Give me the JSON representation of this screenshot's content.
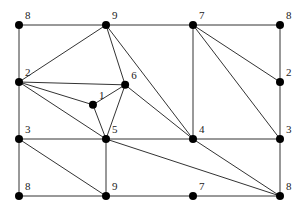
{
  "diagram": {
    "type": "planar-graph",
    "nodes": [
      {
        "id": "n8tl",
        "label": "8",
        "gx": 0,
        "gy": 0
      },
      {
        "id": "n9t",
        "label": "9",
        "gx": 1,
        "gy": 0
      },
      {
        "id": "n7t",
        "label": "7",
        "gx": 2,
        "gy": 0
      },
      {
        "id": "n8tr",
        "label": "8",
        "gx": 3,
        "gy": 0
      },
      {
        "id": "n2l",
        "label": "2",
        "gx": 0,
        "gy": 1
      },
      {
        "id": "n6",
        "label": "6",
        "gx": 1.22,
        "gy": 1.05
      },
      {
        "id": "n1",
        "label": "1",
        "gx": 0.85,
        "gy": 1.4
      },
      {
        "id": "n2r",
        "label": "2",
        "gx": 3,
        "gy": 1
      },
      {
        "id": "n3l",
        "label": "3",
        "gx": 0,
        "gy": 2
      },
      {
        "id": "n5",
        "label": "5",
        "gx": 1,
        "gy": 2
      },
      {
        "id": "n4",
        "label": "4",
        "gx": 2,
        "gy": 2
      },
      {
        "id": "n3r",
        "label": "3",
        "gx": 3,
        "gy": 2
      },
      {
        "id": "n8bl",
        "label": "8",
        "gx": 0,
        "gy": 3
      },
      {
        "id": "n9b",
        "label": "9",
        "gx": 1,
        "gy": 3
      },
      {
        "id": "n7b",
        "label": "7",
        "gx": 2,
        "gy": 3
      },
      {
        "id": "n8br",
        "label": "8",
        "gx": 3,
        "gy": 3
      }
    ],
    "edges": [
      [
        "n8tl",
        "n9t"
      ],
      [
        "n9t",
        "n7t"
      ],
      [
        "n7t",
        "n8tr"
      ],
      [
        "n8tl",
        "n2l"
      ],
      [
        "n2l",
        "n3l"
      ],
      [
        "n3l",
        "n8bl"
      ],
      [
        "n8tr",
        "n2r"
      ],
      [
        "n2r",
        "n3r"
      ],
      [
        "n3r",
        "n8br"
      ],
      [
        "n8bl",
        "n9b"
      ],
      [
        "n9b",
        "n7b"
      ],
      [
        "n7b",
        "n8br"
      ],
      [
        "n9t",
        "n2l"
      ],
      [
        "n9t",
        "n6"
      ],
      [
        "n9t",
        "n4"
      ],
      [
        "n2l",
        "n6"
      ],
      [
        "n2l",
        "n1"
      ],
      [
        "n2l",
        "n5"
      ],
      [
        "n1",
        "n6"
      ],
      [
        "n1",
        "n5"
      ],
      [
        "n6",
        "n5"
      ],
      [
        "n6",
        "n4"
      ],
      [
        "n7t",
        "n4"
      ],
      [
        "n7t",
        "n2r"
      ],
      [
        "n7t",
        "n3r"
      ],
      [
        "n3l",
        "n5"
      ],
      [
        "n5",
        "n4"
      ],
      [
        "n4",
        "n3r"
      ],
      [
        "n3l",
        "n9b"
      ],
      [
        "n5",
        "n9b"
      ],
      [
        "n5",
        "n8br"
      ],
      [
        "n4",
        "n8br"
      ]
    ]
  }
}
